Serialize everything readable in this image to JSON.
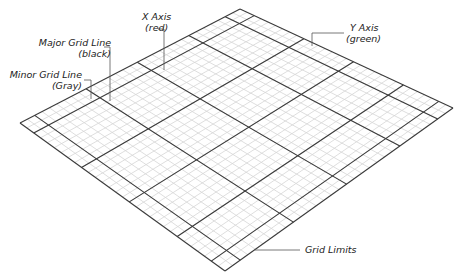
{
  "diagram": {
    "type": "perspective-grid",
    "corners": {
      "left": [
        20,
        123
      ],
      "top": [
        240,
        9
      ],
      "right": [
        453,
        108
      ],
      "bottom": [
        225,
        271
      ]
    },
    "minor_divisions": 30,
    "major_fractions": [
      0.067,
      0.3,
      0.533,
      0.767,
      0.933
    ],
    "colors": {
      "minor": "#d6d6d6",
      "major": "#3a3a3a",
      "leader": "#555555"
    }
  },
  "labels": {
    "x_axis_line1": "X Axis",
    "x_axis_line2": "(red)",
    "major_line1": "Major Grid Line",
    "major_line2": "(black)",
    "minor_line1": "Minor Grid Line",
    "minor_line2": "(Gray)",
    "y_axis_line1": "Y Axis",
    "y_axis_line2": "(green)",
    "grid_limits": "Grid Limits"
  }
}
